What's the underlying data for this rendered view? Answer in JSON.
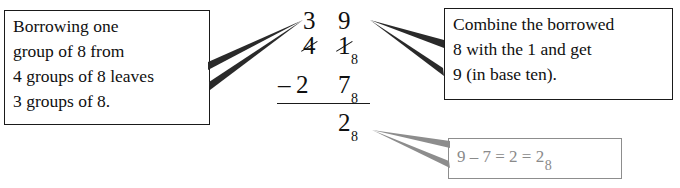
{
  "figure": {
    "ink_color": "#101010",
    "gray_color": "#8a8a8a"
  },
  "callouts": {
    "left": {
      "lines": [
        "Borrowing one",
        "group of 8 from",
        "4 groups of 8 leaves",
        "3 groups of 8."
      ]
    },
    "right": {
      "lines": [
        "Combine the borrowed",
        "8 with the 1 and get",
        "9 (in base ten)."
      ]
    },
    "bottom": {
      "text": "9 – 7 = 2 = 2",
      "subscript": "8"
    }
  },
  "arithmetic": {
    "borrow_row": {
      "tens": "3",
      "ones": "9"
    },
    "minuend_row": {
      "tens": "4",
      "ones": "1",
      "base": "8"
    },
    "subtrahend_row": {
      "operator": "–",
      "tens": "2",
      "ones": "7",
      "base": "8"
    },
    "answer_row": {
      "ones": "2",
      "base": "8"
    }
  }
}
